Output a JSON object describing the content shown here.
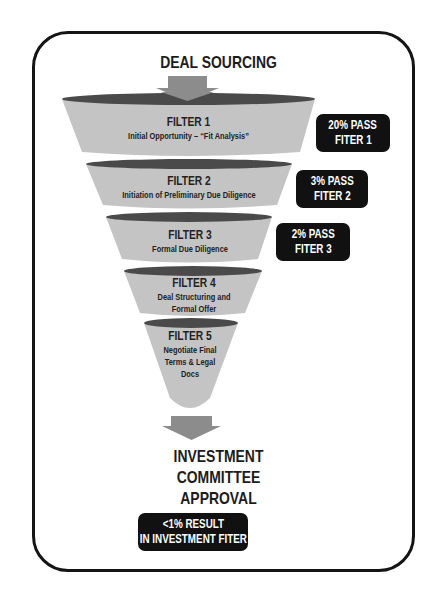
{
  "header": {
    "title": "DEAL SOURCING"
  },
  "colors": {
    "funnel_body": "#c4c4c4",
    "funnel_rim": "#4a4a4a",
    "arrow": "#8c8c8c",
    "badge_bg": "#111111",
    "badge_text": "#ffffff",
    "frame": "#141414"
  },
  "filters": [
    {
      "title": "FILTER 1",
      "description": "Initial Opportunity – “Fit Analysis”"
    },
    {
      "title": "FILTER 2",
      "description": "Initiation of Preliminary Due Diligence"
    },
    {
      "title": "FILTER 3",
      "description": "Formal Due Diligence"
    },
    {
      "title": "FILTER 4",
      "description_lines": [
        "Deal Structuring and",
        "Formal Offer"
      ]
    },
    {
      "title": "FILTER 5",
      "description_lines": [
        "Negotiate Final",
        "Terms & Legal",
        "Docs"
      ]
    }
  ],
  "badges": [
    {
      "line1": "20% PASS",
      "line2": "FITER 1"
    },
    {
      "line1": "3% PASS",
      "line2": "FITER 2"
    },
    {
      "line1": "2% PASS",
      "line2": "FITER 3"
    }
  ],
  "outcome": {
    "title_lines": [
      "INVESTMENT",
      "COMMITTEE",
      "APPROVAL"
    ],
    "badge": {
      "line1": "<1% RESULT",
      "line2": "IN INVESTMENT FITER"
    }
  }
}
